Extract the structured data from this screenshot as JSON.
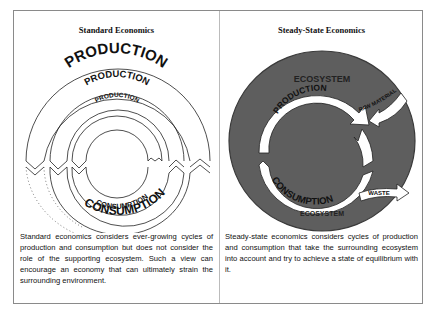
{
  "figure": {
    "left_panel": {
      "title": "Standard Economics",
      "labels": {
        "production_outer": "PRODUCTION",
        "production_middle": "PRODUCTION",
        "production_inner": "PRODUCTION",
        "consumption_inner": "CONSUMPTION",
        "consumption_outer": "CONSUMPTION"
      },
      "caption": "Standard economics considers ever-growing cycles of production and consumption but does not consider the role of the supporting ecosystem. Such a view can encourage an economy that can ultimately strain the surrounding environment."
    },
    "right_panel": {
      "title": "Steady-State Economics",
      "labels": {
        "ecosystem_top": "ECOSYSTEM",
        "production": "PRODUCTION",
        "raw_materials": "RAW MATERIALS",
        "consumption": "CONSUMPTION",
        "waste": "WASTE",
        "ecosystem_bottom": "ECOSYSTEM"
      },
      "caption": "Steady-state economics considers cycles of production and consumption that take the surrounding ecosystem into account and try to achieve a state of equilibrium with it."
    },
    "colors": {
      "ecosystem_fill": "#5e5e5e",
      "ecosystem_edge": "#3a3a3a",
      "arrow_fill": "#ffffff",
      "line": "#222222",
      "frame": "#8a8a8a"
    }
  }
}
